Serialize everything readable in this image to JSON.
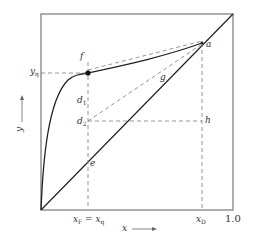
{
  "diagram": {
    "type": "McCabe-Thiele x-y diagram",
    "axes": {
      "x_label": "x",
      "y_label": "y",
      "x_end_tick": "1.0",
      "x_ticks": [
        {
          "main": "x",
          "sub": "F",
          "eq": " = ",
          "main2": "x",
          "sub2": "q"
        },
        {
          "main": "x",
          "sub": "D"
        }
      ],
      "y_ticks": [
        {
          "main": "y",
          "sub": "q"
        }
      ]
    },
    "points": {
      "a": "a",
      "e": "e",
      "f": "f",
      "g": "g",
      "h": "h",
      "d1_main": "d",
      "d1_sub": "1",
      "d2_main": "d",
      "d2_sub": "2"
    },
    "colors": {
      "frame": "#8a8a8a",
      "curve": "#222222",
      "dashed": "#8a8a8a",
      "text": "#333333"
    }
  }
}
